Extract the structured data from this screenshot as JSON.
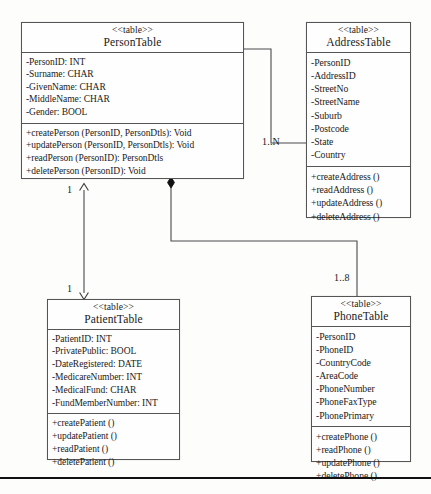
{
  "diagram": {
    "type": "uml-class-diagram",
    "classes": [
      {
        "id": "person-table",
        "stereotype": "<<table>>",
        "name": "PersonTable",
        "attributes": [
          "-PersonID: INT",
          "-Surname: CHAR",
          "-GivenName: CHAR",
          "-MiddleName: CHAR",
          "-Gender: BOOL"
        ],
        "operations": [
          "+createPerson (PersonID, PersonDtls): Void",
          "+updatePerson (PersonID, PersonDtls): Void",
          "+readPerson (PersonID): PersonDtls",
          "+deletePerson (PersonID): Void"
        ]
      },
      {
        "id": "address-table",
        "stereotype": "<<table>>",
        "name": "AddressTable",
        "attributes": [
          "-PersonID",
          "-AddressID",
          "-StreetNo",
          "-StreetName",
          "-Suburb",
          "-Postcode",
          "-State",
          "-Country"
        ],
        "operations": [
          "+createAddress ()",
          "+readAddress ()",
          "+updateAddress ()",
          "+deleteAddress ()"
        ]
      },
      {
        "id": "patient-table",
        "stereotype": "<<table>>",
        "name": "PatientTable",
        "attributes": [
          "-PatientID: INT",
          "-PrivatePublic: BOOL",
          "-DateRegistered: DATE",
          "-MedicareNumber: INT",
          "-MedicalFund: CHAR",
          "-FundMemberNumber: INT"
        ],
        "operations": [
          "+createPatient ()",
          "+updatePatient ()",
          "+readPatient ()",
          "+deletePatient ()"
        ]
      },
      {
        "id": "phone-table",
        "stereotype": "<<table>>",
        "name": "PhoneTable",
        "attributes": [
          "-PersonID",
          "-PhoneID",
          "-CountryCode",
          "-AreaCode",
          "-PhoneNumber",
          "-PhoneFaxType",
          "-PhonePrimary"
        ],
        "operations": [
          "+createPhone ()",
          "+readPhone ()",
          "+updatePhone ()",
          "+deletePhone ()"
        ]
      }
    ],
    "relationships": [
      {
        "id": "person-address",
        "from": "PersonTable",
        "to": "AddressTable",
        "kind": "composition",
        "multiplicity": "1..N"
      },
      {
        "id": "person-phone",
        "from": "PersonTable",
        "to": "PhoneTable",
        "kind": "composition",
        "multiplicity": "1..8"
      },
      {
        "id": "person-patient",
        "from": "PersonTable",
        "to": "PatientTable",
        "kind": "association-bidirectional",
        "multiplicity_source": "1",
        "multiplicity_target": "1"
      }
    ],
    "multiplicity_labels": {
      "person_address": "1..N",
      "person_phone": "1..8",
      "person_patient_top": "1",
      "person_patient_bottom": "1"
    }
  },
  "footer": {
    "caption": ""
  },
  "colors": {
    "line": "#555555",
    "text": "#1a1a1a",
    "background": "#fdfdfc",
    "rule": "#111111"
  }
}
